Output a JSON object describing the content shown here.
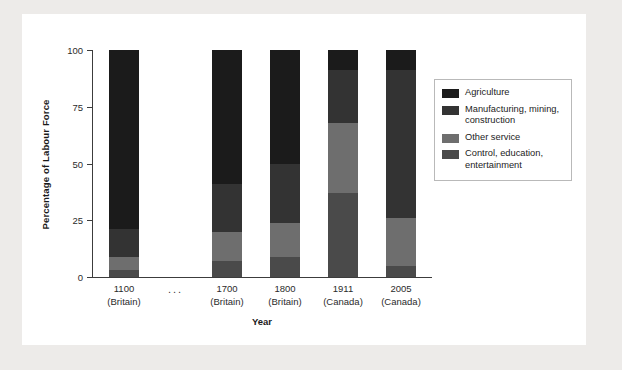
{
  "figure": {
    "page_background": "#edebe9",
    "card_background": "#ffffff"
  },
  "axes": {
    "ylabel": "Percentage of Labour Force",
    "xlabel": "Year",
    "yticks": [
      0,
      25,
      50,
      75,
      100
    ],
    "ytick_labels": [
      "0",
      "25",
      "50",
      "75",
      "100"
    ],
    "ylim": [
      0,
      100
    ],
    "axis_color": "#3c3c3c",
    "gap_marker": "..."
  },
  "legend": {
    "position": "right",
    "entries": [
      {
        "label": "Agriculture",
        "color": "#1b1b1b"
      },
      {
        "label": "Manufacturing, mining, construction",
        "color": "#333333"
      },
      {
        "label": "Other service",
        "color": "#6e6e6e"
      },
      {
        "label": "Control, education, entertainment",
        "color": "#4a4a4a"
      }
    ]
  },
  "chart_data": {
    "type": "bar",
    "subtype": "stacked",
    "title": "",
    "xlabel": "Year",
    "ylabel": "Percentage of Labour Force",
    "ylim": [
      0,
      100
    ],
    "grid": false,
    "legend_position": "right",
    "categories": [
      "1100\n(Britain)",
      "1700\n(Britain)",
      "1800\n(Britain)",
      "1911\n(Canada)",
      "2005\n(Canada)"
    ],
    "category_labels": [
      {
        "year": "1100",
        "place": "(Britain)"
      },
      {
        "year": "1700",
        "place": "(Britain)"
      },
      {
        "year": "1800",
        "place": "(Britain)"
      },
      {
        "year": "1911",
        "place": "(Canada)"
      },
      {
        "year": "2005",
        "place": "(Canada)"
      }
    ],
    "series": [
      {
        "name": "Control, education, entertainment",
        "color": "#4a4a4a",
        "texture": "flat",
        "values": [
          3,
          7,
          9,
          37,
          5
        ]
      },
      {
        "name": "Other service",
        "color": "#6e6e6e",
        "texture": "flat",
        "values": [
          6,
          13,
          15,
          31,
          21
        ]
      },
      {
        "name": "Manufacturing, mining, construction",
        "color": "#333333",
        "texture": "diag",
        "values": [
          12,
          21,
          26,
          23,
          65
        ]
      },
      {
        "name": "Agriculture",
        "color": "#1b1b1b",
        "texture": "cross",
        "values": [
          79,
          59,
          50,
          9,
          9
        ]
      }
    ],
    "stack_order_bottom_to_top": [
      "Control, education, entertainment",
      "Other service",
      "Manufacturing, mining, construction",
      "Agriculture"
    ]
  }
}
